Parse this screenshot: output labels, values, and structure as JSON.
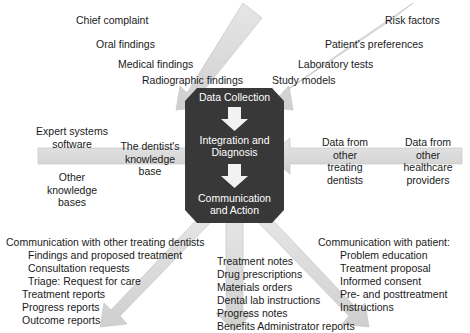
{
  "diagram": {
    "core_stages": [
      {
        "label": "Data Collection"
      },
      {
        "label": "Integration and\nDiagnosis"
      },
      {
        "label": "Communication\nand Action"
      }
    ],
    "inputs_top_left": [
      "Chief complaint",
      "Oral findings",
      "Medical findings",
      "Radiographic findings"
    ],
    "inputs_top_right": [
      "Risk factors",
      "Patient's preferences",
      "Laboratory tests",
      "Study models"
    ],
    "left_side": {
      "above": "Expert systems\nsoftware",
      "arrow_label": "The dentist's\nknowledge\nbase",
      "below": "Other\nknowledge\nbases"
    },
    "right_side": {
      "item_1": "Data from\nother\ntreating\ndentists",
      "item_2": "Data from\nother\nhealthcare\nproviders"
    },
    "outputs_bottom_left": {
      "heading": "Communication with other treating dentists",
      "items": [
        "Findings and proposed treatment",
        "Consultation requests",
        "Triage: Request for care",
        "Treatment reports",
        "Progress reports",
        "Outcome reports"
      ]
    },
    "outputs_bottom_center": {
      "items": [
        "Treatment notes",
        "Drug prescriptions",
        "Materials orders",
        "Dental lab instructions",
        "Progress notes",
        "Benefits Administrator reports"
      ]
    },
    "outputs_bottom_right": {
      "heading": "Communication with patient:",
      "items": [
        "Problem education",
        "Treatment proposal",
        "Informed consent",
        "Pre- and posttreatment",
        "Instructions"
      ]
    },
    "colors": {
      "core_box": "#383838",
      "core_text": "#ffffff",
      "arrow_fill": "#d9d9d9",
      "arrow_stroke": "#c3c3c3",
      "text": "#1a1a1a",
      "background": "#ffffff"
    }
  }
}
